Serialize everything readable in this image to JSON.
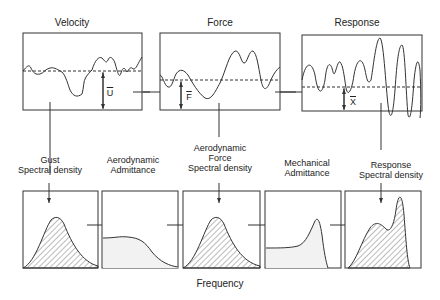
{
  "top_row": {
    "velocity": {
      "title": "Velocity",
      "mean_symbol": "U"
    },
    "force": {
      "title": "Force",
      "mean_symbol": "F"
    },
    "response": {
      "title": "Response",
      "mean_symbol": "X"
    }
  },
  "bottom_row": {
    "labels": [
      "Gust\nSpectral density",
      "Aerodynamic\nAdmittance",
      "Aerodynamic\nForce\nSpectral density",
      "Mechanical\nAdmittance",
      "Response\nSpectral density"
    ],
    "x_axis_label": "Frequency"
  },
  "colors": {
    "stroke": "#333333",
    "fill": "#f2f2f2",
    "hatch": "#555555"
  }
}
